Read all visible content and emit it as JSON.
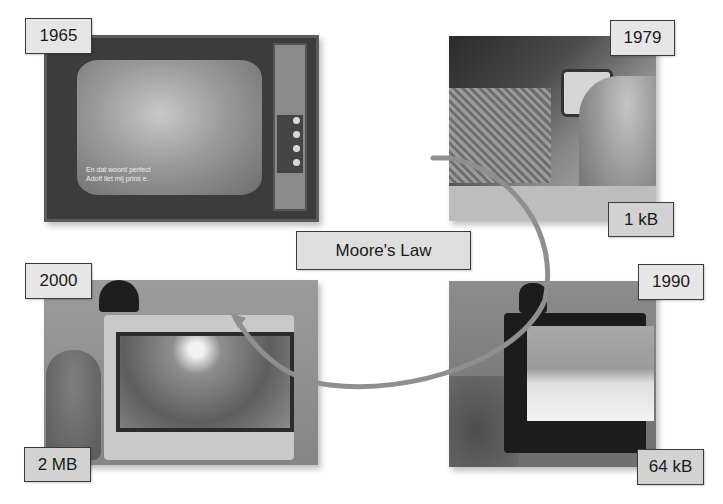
{
  "title": "Moore's Law",
  "arc_color": "#8f8f8f",
  "panels": [
    {
      "id": "1965",
      "year": "1965",
      "memory": "",
      "subtitle_lines": [
        "En dat woord perfect",
        "Adolf liet mij prins e."
      ]
    },
    {
      "id": "1979",
      "year": "1979",
      "memory": "1 kB"
    },
    {
      "id": "1990",
      "year": "1990",
      "memory": "64 kB"
    },
    {
      "id": "2000",
      "year": "2000",
      "memory": "2 MB"
    }
  ],
  "labels": {
    "y1965": "1965",
    "y1979": "1979",
    "m1979": "1 kB",
    "y1990": "1990",
    "m1990": "64 kB",
    "y2000": "2000",
    "m2000": "2 MB",
    "center": "Moore's Law"
  }
}
